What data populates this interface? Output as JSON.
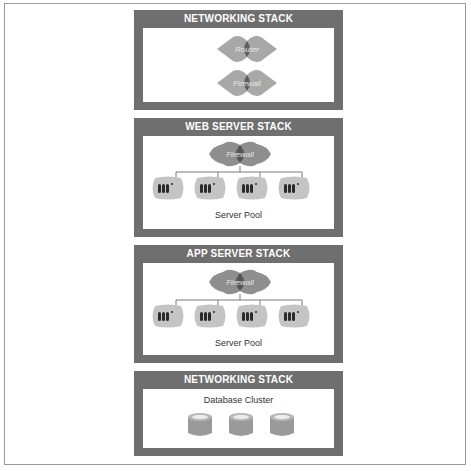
{
  "diagram": {
    "colors": {
      "panel": "#6f6f6f",
      "panel_title_text": "#ffffff",
      "device_light": "#a8a8a8",
      "device_overlap": "#5e5e5e",
      "server_blob": "#c4c4c4",
      "server_bar": "#2a2a2a",
      "connector": "#7a7a7a",
      "database": "#9a9a9a"
    },
    "stacks": [
      {
        "title": "NETWORKING STACK",
        "devices": [
          {
            "type": "router-icon",
            "label": "Router"
          },
          {
            "type": "firewall-icon",
            "label": "Firewall"
          }
        ]
      },
      {
        "title": "WEB SERVER STACK",
        "devices": [
          {
            "type": "firewall-icon",
            "label": "Firewall"
          }
        ],
        "server_pool": {
          "label": "Server Pool",
          "server_count": 4
        }
      },
      {
        "title": "APP SERVER STACK",
        "devices": [
          {
            "type": "firewall-icon",
            "label": "Firewall"
          }
        ],
        "server_pool": {
          "label": "Server Pool",
          "server_count": 4
        }
      },
      {
        "title": "NETWORKING STACK",
        "database_cluster": {
          "label": "Database Cluster",
          "database_count": 3
        }
      }
    ]
  }
}
